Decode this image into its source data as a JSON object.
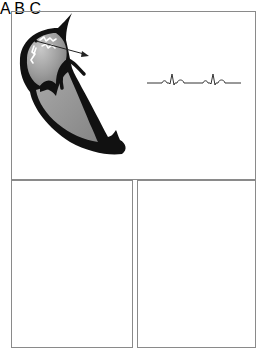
{
  "figure": {
    "colors": {
      "frame": "#8a8a8a",
      "myocardium": "#111111",
      "chamber_fill": "#9a9a9a",
      "chamber_highlight": "#c4c4c4",
      "ecg_line": "#333333",
      "background": "#ffffff"
    },
    "panels": [
      {
        "id": "A",
        "label": "A",
        "features": [
          "heart cross-section",
          "activation wavefront (white squiggles)",
          "arrow showing conduction direction",
          "ECG trace with two P-QRS-T complexes"
        ]
      },
      {
        "id": "B",
        "label": "B",
        "features": [
          "heart cross-section",
          "single dot at origin (focal point)",
          "ECG trace with one complex"
        ]
      },
      {
        "id": "C",
        "label": "C",
        "features": [
          "heart cross-section",
          "short activation front with arrow",
          "ECG trace with one complex"
        ]
      }
    ]
  }
}
